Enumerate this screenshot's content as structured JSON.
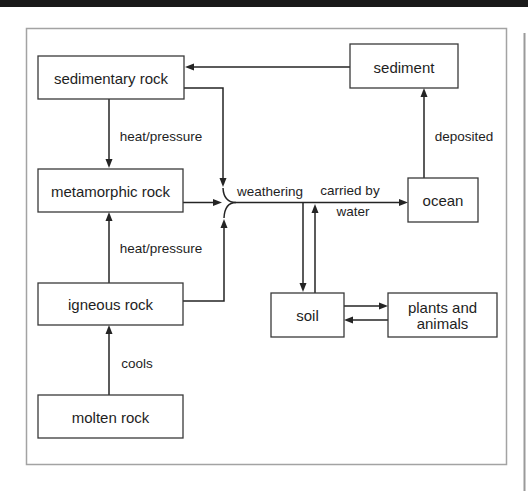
{
  "colors": {
    "top_bar": "#1a1a1a",
    "page_background": "#ffffff",
    "frame_border": "#a3a3a3",
    "page_edge_line": "#9a9a9a",
    "box_border": "#3a3a3a",
    "box_fill": "#ffffff",
    "arrow": "#242424",
    "text": "#1e1e1e"
  },
  "diagram": {
    "nodes": {
      "sedimentary_rock": "sedimentary rock",
      "sediment": "sediment",
      "metamorphic_rock": "metamorphic rock",
      "ocean": "ocean",
      "igneous_rock": "igneous rock",
      "soil": "soil",
      "plants_and_animals_line1": "plants and",
      "plants_and_animals_line2": "animals",
      "molten_rock": "molten rock"
    },
    "edge_labels": {
      "heat_pressure_top": "heat/pressure",
      "heat_pressure_bottom": "heat/pressure",
      "cools": "cools",
      "weathering": "weathering",
      "carried_by": "carried by",
      "water": "water",
      "deposited": "deposited"
    }
  }
}
